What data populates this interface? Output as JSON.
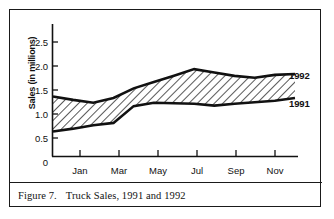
{
  "figure": {
    "caption_label": "Figure 7.",
    "caption_text": "Truck Sales, 1991 and 1992"
  },
  "chart_data": {
    "type": "area",
    "title": "Truck Sales, 1991 and 1992",
    "xlabel": "",
    "ylabel": "Sales (in millions)",
    "x": [
      "Dec",
      "Jan",
      "Feb",
      "Mar",
      "Apr",
      "May",
      "Jun",
      "Jul",
      "Aug",
      "Sep",
      "Oct",
      "Nov",
      "Dec"
    ],
    "xtick_labels": [
      "Jan",
      "Mar",
      "May",
      "Jul",
      "Sep",
      "Nov"
    ],
    "ytick_labels": [
      "0",
      "0.5",
      "1.0",
      "1.5",
      "2.0",
      "2.5"
    ],
    "ytick_values": [
      0,
      0.5,
      1.0,
      1.5,
      2.0,
      2.5
    ],
    "ylim": [
      0,
      2.75
    ],
    "grid": false,
    "legend_position": "right-inline",
    "fill_pattern": "diagonal-hatch",
    "series": [
      {
        "name": "1992",
        "label": "1992",
        "values": [
          1.25,
          1.18,
          1.12,
          1.22,
          1.42,
          1.55,
          1.68,
          1.82,
          1.75,
          1.68,
          1.64,
          1.7,
          1.72
        ]
      },
      {
        "name": "1991",
        "label": "1991",
        "values": [
          0.52,
          0.58,
          0.65,
          0.7,
          1.05,
          1.12,
          1.11,
          1.1,
          1.06,
          1.1,
          1.13,
          1.16,
          1.22
        ]
      }
    ]
  },
  "colors": {
    "line": "#111111",
    "frame": "#1a1a1a",
    "background": "#ffffff"
  }
}
